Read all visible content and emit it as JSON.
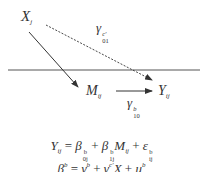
{
  "diagram": {
    "nodes": {
      "x": {
        "base": "X",
        "sub": "j"
      },
      "m": {
        "base": "M",
        "sub": "ij"
      },
      "y": {
        "base": "Y",
        "sub": "ij"
      }
    },
    "edges": {
      "direct": {
        "base": "γ",
        "sup": "c′",
        "sub": "01",
        "style": "dashed"
      },
      "mediator_to_outcome": {
        "base": "γ",
        "sup": "b",
        "sub": "10",
        "style": "solid"
      },
      "x_to_mediator": {
        "style": "solid"
      }
    },
    "level_divider": {
      "style": "solid",
      "color": "#555555"
    }
  },
  "equations": {
    "eq1": {
      "lhs": "Y",
      "lhs_sub": "ij",
      "eq": " = ",
      "t1": "β",
      "t1_sup": "b",
      "t1_sub": "0j",
      "plus1": " + ",
      "t2": "β",
      "t2_sup": "b",
      "t2_sub": "1j",
      "t2_var": "M",
      "t2_var_sub": "ij",
      "plus2": " + ",
      "t3": "ε",
      "t3_sup": "b",
      "t3_sub": "ij"
    },
    "eq2_partial": {
      "lhs": "β",
      "lhs_sup": "b",
      "eq": " = ",
      "t1": "γ",
      "t1_sup": "b",
      "plus1": " + ",
      "t2": "γ",
      "t2_sup": "c′",
      "t2_var": "X",
      "plus2": " + ",
      "t3": "u",
      "t3_sup": "b"
    }
  }
}
